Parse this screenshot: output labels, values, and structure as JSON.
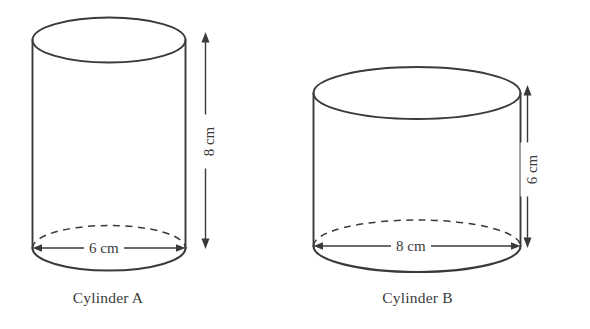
{
  "figure": {
    "background_color": "#ffffff",
    "line_color": "#3a3a3a",
    "cylinders": [
      {
        "id": "cylinder-a",
        "caption": "Cylinder A",
        "diameter_label": "6 cm",
        "height_label": "8 cm",
        "diameter_value": 6,
        "height_value": 8,
        "units": "cm"
      },
      {
        "id": "cylinder-b",
        "caption": "Cylinder B",
        "diameter_label": "8 cm",
        "height_label": "6 cm",
        "diameter_value": 8,
        "height_value": 6,
        "units": "cm"
      }
    ]
  }
}
